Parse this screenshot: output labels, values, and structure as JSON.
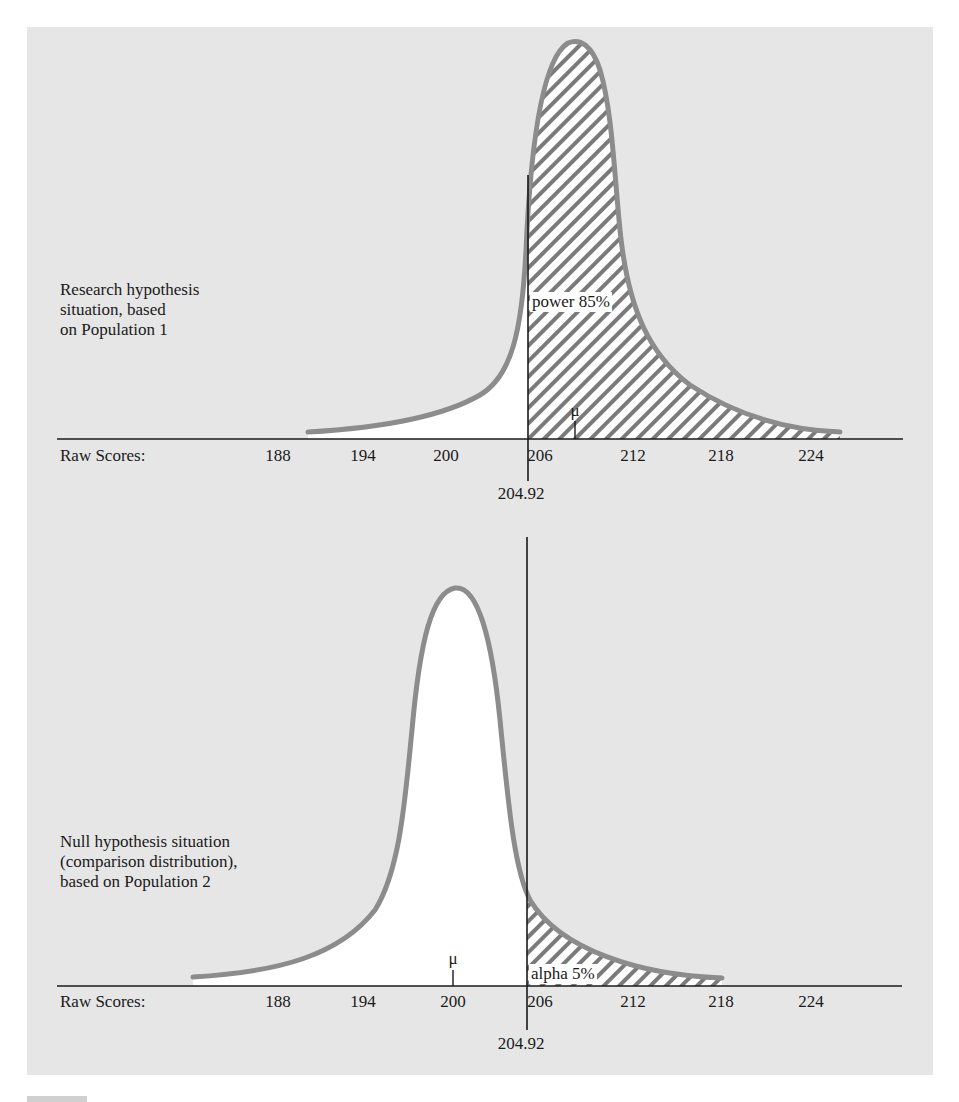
{
  "chart_data": [
    {
      "type": "area",
      "title": "Research hypothesis situation, based on Population 1",
      "distribution": "Population 1",
      "mean": 208,
      "xlabel": "Raw Scores:",
      "tick_values": [
        188,
        194,
        200,
        206,
        212,
        218,
        224
      ],
      "tick_labels": [
        "188",
        "194",
        "200",
        "206",
        "212",
        "218",
        "224"
      ],
      "cutoff": 204.92,
      "cutoff_label": "204.92",
      "shaded_region": "right of cutoff",
      "shaded_label": "power 85%",
      "mean_label": "μ",
      "grid": false
    },
    {
      "type": "area",
      "title": "Null hypothesis situation (comparison distribution), based on Population 2",
      "distribution": "Population 2",
      "mean": 200,
      "xlabel": "Raw Scores:",
      "tick_values": [
        188,
        194,
        200,
        206,
        212,
        218,
        224
      ],
      "tick_labels": [
        "188",
        "194",
        "200",
        "206",
        "212",
        "218",
        "224"
      ],
      "cutoff": 204.92,
      "cutoff_label": "204.92",
      "shaded_region": "right of cutoff",
      "shaded_label": "alpha 5%",
      "mean_label": "μ",
      "grid": false
    }
  ],
  "top": {
    "description": "Research hypothesis\nsituation, based\non Population 1",
    "axis_label": "Raw Scores:",
    "ticks": [
      {
        "label": "188",
        "x": 278
      },
      {
        "label": "194",
        "x": 363
      },
      {
        "label": "200",
        "x": 446
      },
      {
        "label": "206",
        "x": 540
      },
      {
        "label": "212",
        "x": 633
      },
      {
        "label": "218",
        "x": 721
      },
      {
        "label": "224",
        "x": 811
      }
    ],
    "shaded_label": "power 85%",
    "mean_label": "μ",
    "cutoff_label": "204.92"
  },
  "bottom": {
    "description": "Null hypothesis situation\n(comparison distribution),\nbased on Population 2",
    "axis_label": "Raw Scores:",
    "ticks": [
      {
        "label": "188",
        "x": 278
      },
      {
        "label": "194",
        "x": 363
      },
      {
        "label": "200",
        "x": 453
      },
      {
        "label": "206",
        "x": 540
      },
      {
        "label": "212",
        "x": 633
      },
      {
        "label": "218",
        "x": 721
      },
      {
        "label": "224",
        "x": 811
      }
    ],
    "shaded_label": "alpha 5%",
    "mean_label": "μ",
    "cutoff_label": "204.92"
  },
  "colors": {
    "panel": "#e6e6e6",
    "curve": "#8c8c8c",
    "hatch": "#7a7a7a",
    "axis": "#1a1a1a",
    "fill": "#ffffff"
  }
}
